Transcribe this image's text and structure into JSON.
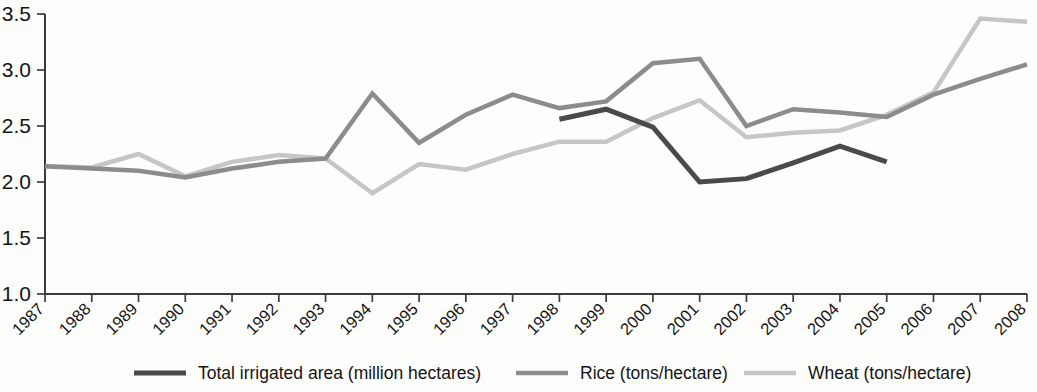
{
  "chart_data": {
    "type": "line",
    "title": "",
    "xlabel": "",
    "ylabel": "",
    "grid": false,
    "legend_position": "bottom",
    "ylim": [
      1.0,
      3.5
    ],
    "yticks": [
      "1.0",
      "1.5",
      "2.0",
      "2.5",
      "3.0",
      "3.5"
    ],
    "ytick_values": [
      1.0,
      1.5,
      2.0,
      2.5,
      3.0,
      3.5
    ],
    "categories": [
      "1987",
      "1988",
      "1989",
      "1990",
      "1991",
      "1992",
      "1993",
      "1994",
      "1995",
      "1996",
      "1997",
      "1998",
      "1999",
      "2000",
      "2001",
      "2002",
      "2003",
      "2004",
      "2005",
      "2006",
      "2007",
      "2008"
    ],
    "series": [
      {
        "name": "Total irrigated area (million hectares)",
        "color": "#4a4a4a",
        "values": [
          null,
          null,
          null,
          null,
          null,
          null,
          null,
          null,
          null,
          null,
          null,
          2.56,
          2.65,
          2.49,
          2.0,
          2.03,
          2.17,
          2.32,
          2.18,
          null,
          null,
          null
        ]
      },
      {
        "name": "Rice (tons/hectare)",
        "color": "#8c8c8c",
        "values": [
          2.14,
          2.12,
          2.1,
          2.04,
          2.12,
          2.18,
          2.21,
          2.79,
          2.35,
          2.6,
          2.78,
          2.66,
          2.72,
          3.06,
          3.1,
          2.5,
          2.65,
          2.62,
          2.58,
          2.78,
          2.92,
          3.05
        ]
      },
      {
        "name": "Wheat (tons/hectare)",
        "color": "#c6c6c6",
        "values": [
          2.14,
          2.13,
          2.25,
          2.05,
          2.18,
          2.24,
          2.21,
          1.9,
          2.16,
          2.11,
          2.25,
          2.36,
          2.36,
          2.57,
          2.73,
          2.4,
          2.44,
          2.46,
          2.6,
          2.8,
          3.46,
          3.43
        ]
      }
    ]
  },
  "legend": {
    "items": [
      {
        "label": "Total irrigated area (million hectares)",
        "color": "#4a4a4a"
      },
      {
        "label": "Rice (tons/hectare)",
        "color": "#8c8c8c"
      },
      {
        "label": "Wheat (tons/hectare)",
        "color": "#c6c6c6"
      }
    ]
  }
}
